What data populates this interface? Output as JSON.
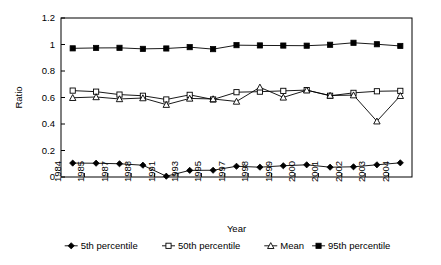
{
  "chart_data": {
    "type": "line",
    "title": "",
    "xlabel": "Year",
    "ylabel": "Ratio",
    "ylim": [
      0,
      1.2
    ],
    "ytick_labels": [
      "0",
      "0.2",
      "0.4",
      "0.6",
      "0.8",
      "1",
      "1.2"
    ],
    "ytick_values": [
      0,
      0.2,
      0.4,
      0.6,
      0.8,
      1,
      1.2
    ],
    "xtick_labels": [
      "1984",
      "1985",
      "1987",
      "1988",
      "1991",
      "1993",
      "1995",
      "1997",
      "1998",
      "1999",
      "2000",
      "2001",
      "2002",
      "2003",
      "2004"
    ],
    "grid": false,
    "legend_position": "bottom",
    "frame": "box",
    "series": [
      {
        "name": "5th percentile",
        "marker": "filled-diamond",
        "values": [
          0.105,
          0.104,
          0.1,
          0.089,
          0.006,
          0.05,
          0.051,
          0.081,
          0.074,
          0.085,
          0.092,
          0.074,
          0.077,
          0.092,
          0.107
        ]
      },
      {
        "name": "50th percentile",
        "marker": "open-square",
        "values": [
          0.652,
          0.644,
          0.622,
          0.613,
          0.585,
          0.62,
          0.585,
          0.64,
          0.644,
          0.65,
          0.656,
          0.613,
          0.635,
          0.647,
          0.65
        ]
      },
      {
        "name": "Mean",
        "marker": "open-triangle",
        "values": [
          0.598,
          0.604,
          0.589,
          0.596,
          0.546,
          0.593,
          0.589,
          0.57,
          0.677,
          0.601,
          0.655,
          0.615,
          0.618,
          0.421,
          0.613
        ]
      },
      {
        "name": "95th percentile",
        "marker": "filled-square",
        "values": [
          0.971,
          0.974,
          0.975,
          0.967,
          0.97,
          0.98,
          0.965,
          0.995,
          0.993,
          0.992,
          0.991,
          0.998,
          1.013,
          1.002,
          0.989
        ]
      }
    ]
  },
  "legend": {
    "items": [
      {
        "label": "5th percentile",
        "marker": "filled-diamond"
      },
      {
        "label": "50th percentile",
        "marker": "open-square"
      },
      {
        "label": "Mean",
        "marker": "open-triangle"
      },
      {
        "label": "95th percentile",
        "marker": "filled-square"
      }
    ]
  },
  "colors": {
    "line": "#000000",
    "axis": "#000000",
    "background": "#ffffff",
    "marker_fill_open": "#ffffff"
  }
}
